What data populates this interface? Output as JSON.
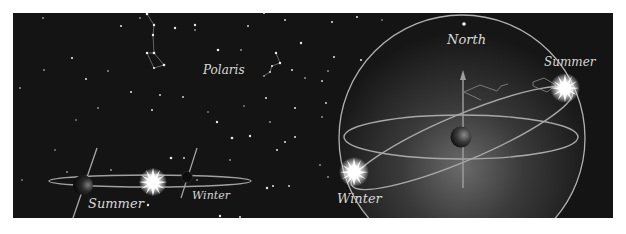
{
  "figure": {
    "background": "#ffffff",
    "panel_color": "#141414",
    "line_color": "#b8b8b8",
    "labels": {
      "polaris": "Polaris",
      "north": "North",
      "summer_left": "Summer",
      "winter_left": "Winter",
      "summer_right": "Summer",
      "winter_right": "Winter"
    }
  },
  "left_scene": {
    "description": "Earth orbiting the Sun, tilted axis pointing toward Polaris",
    "positions": [
      "Summer",
      "Winter"
    ]
  },
  "right_scene": {
    "description": "Celestial sphere with Earth at center; Sun on ecliptic at Summer and Winter positions",
    "positions": [
      "North",
      "Summer",
      "Winter"
    ]
  }
}
